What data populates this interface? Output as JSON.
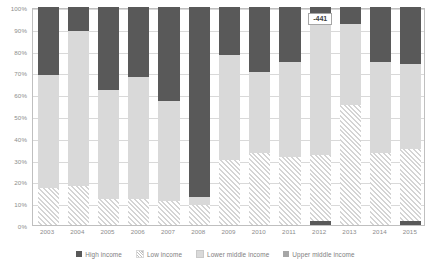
{
  "chart_data": {
    "type": "bar",
    "title": "",
    "subtitle": "",
    "xlabel": "",
    "ylabel": "",
    "stacked": true,
    "stack_mode": "percent",
    "grid": true,
    "legend_position": "bottom",
    "ylim": [
      0,
      100
    ],
    "ytick_labels": [
      "0%",
      "10%",
      "20%",
      "30%",
      "40%",
      "50%",
      "60%",
      "70%",
      "80%",
      "90%",
      "100%"
    ],
    "ytick_values": [
      0,
      10,
      20,
      30,
      40,
      50,
      60,
      70,
      80,
      90,
      100
    ],
    "categories": [
      "2003",
      "2004",
      "2005",
      "2006",
      "2007",
      "2008",
      "2009",
      "2010",
      "2011",
      "2012",
      "2013",
      "2014",
      "2015"
    ],
    "series": [
      {
        "name": "Low income",
        "color": "#d4d4d4",
        "pattern": "diagonal-hatch",
        "values": [
          17,
          18,
          12,
          12,
          11,
          9,
          30,
          33,
          31,
          30,
          55,
          33,
          33
        ]
      },
      {
        "name": "Lower middle income",
        "color": "#d9d9d9",
        "values": [
          52,
          71,
          50,
          56,
          46,
          4,
          48,
          37,
          44,
          61,
          37,
          42,
          39
        ]
      },
      {
        "name": "Upper middle income",
        "color": "#a6a6a6",
        "values": [
          0,
          0,
          0,
          0,
          0,
          0,
          0,
          0,
          0,
          0,
          0,
          0,
          0
        ]
      },
      {
        "name": "High income",
        "color": "#595959",
        "values": [
          31,
          11,
          38,
          32,
          43,
          87,
          22,
          30,
          25,
          9,
          8,
          25,
          28
        ]
      }
    ],
    "bottom_slivers": {
      "description": "small High income segment at base of bar",
      "series": "High income",
      "values": {
        "2012": 2,
        "2015": 2
      }
    },
    "annotations": [
      {
        "text": "-441",
        "category": "2012",
        "value": 96
      }
    ],
    "legend": [
      {
        "label": "High income",
        "swatch": "high-income-swatch"
      },
      {
        "label": "Low income",
        "swatch": "low-income-swatch"
      },
      {
        "label": "Lower middle income",
        "swatch": "lower-middle-income-swatch"
      },
      {
        "label": "Upper middle income",
        "swatch": "upper-middle-income-swatch"
      }
    ]
  }
}
